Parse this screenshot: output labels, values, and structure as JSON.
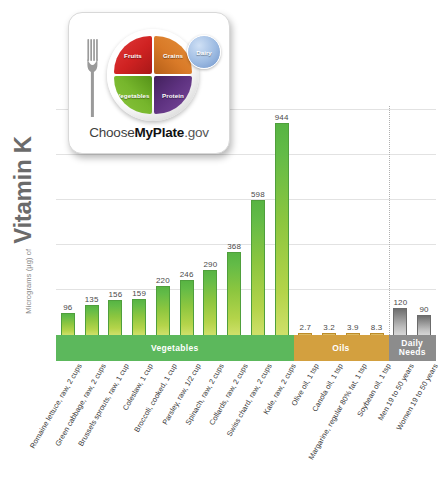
{
  "yaxis": {
    "prefix": "Micrograms (µg) of",
    "title": "Vitamin K"
  },
  "logo": {
    "name": "choose-myplate-logo",
    "wordmark_prefix": "Choose",
    "wordmark_bold": "MyPlate",
    "wordmark_suffix": ".gov",
    "segments": [
      {
        "key": "fruits",
        "label": "Fruits",
        "color": "#cf2222"
      },
      {
        "key": "grains",
        "label": "Grains",
        "color": "#d97a28"
      },
      {
        "key": "vegetables",
        "label": "Vegetables",
        "color": "#76b62c"
      },
      {
        "key": "protein",
        "label": "Protein",
        "color": "#5e3280"
      },
      {
        "key": "dairy",
        "label": "Dairy",
        "color": "#9dbbe2"
      }
    ]
  },
  "bands": [
    {
      "key": "vegetables",
      "label": "Vegetables",
      "color": "#5cb85c"
    },
    {
      "key": "oils",
      "label": "Oils",
      "color": "#d3a03f"
    },
    {
      "key": "daily-needs",
      "label": "Daily Needs",
      "color": "#8c8c8c"
    }
  ],
  "chart_data": {
    "type": "bar",
    "title": "",
    "xlabel": "",
    "ylabel": "Micrograms (µg) of Vitamin K",
    "ylim": [
      0,
      1000
    ],
    "grid": true,
    "gridlines": [
      200,
      400,
      600,
      800,
      1000
    ],
    "legend": "none",
    "categories": [
      "Romaine lettuce, raw, 2 cups",
      "Green cabbage, raw, 2 cups",
      "Brussels sprouts, raw, 1 cup",
      "Coleslaw, 1 cup",
      "Broccoli, cooked, 1 cup",
      "Parsley, raw, 1/2 cup",
      "Spinach, raw, 2 cups",
      "Collards, raw, 2 cups",
      "Swiss chard, raw, 2 cups",
      "Kale, raw, 2 cups",
      "Olive oil, 1 tsp",
      "Canola oil, 1 tsp",
      "Margarine, regular 80% fat, 1 tsp",
      "Soybean oil, 1 tsp",
      "Men 19 to 50 years",
      "Women 19 to 50 years"
    ],
    "values": [
      96,
      135,
      156,
      159,
      220,
      246,
      290,
      368,
      598,
      944,
      2.7,
      3.2,
      3.9,
      8.3,
      120,
      90
    ],
    "value_labels": [
      "96",
      "135",
      "156",
      "159",
      "220",
      "246",
      "290",
      "368",
      "598",
      "944",
      "2.7",
      "3.2",
      "3.9",
      "8.3",
      "120",
      "90"
    ],
    "groups": [
      {
        "name": "Vegetables",
        "color": "#8cc63f",
        "start": 0,
        "end": 9
      },
      {
        "name": "Oils",
        "color": "#d3a03f",
        "start": 10,
        "end": 13
      },
      {
        "name": "Daily Needs",
        "color": "#8c8c8c",
        "start": 14,
        "end": 15
      }
    ]
  }
}
